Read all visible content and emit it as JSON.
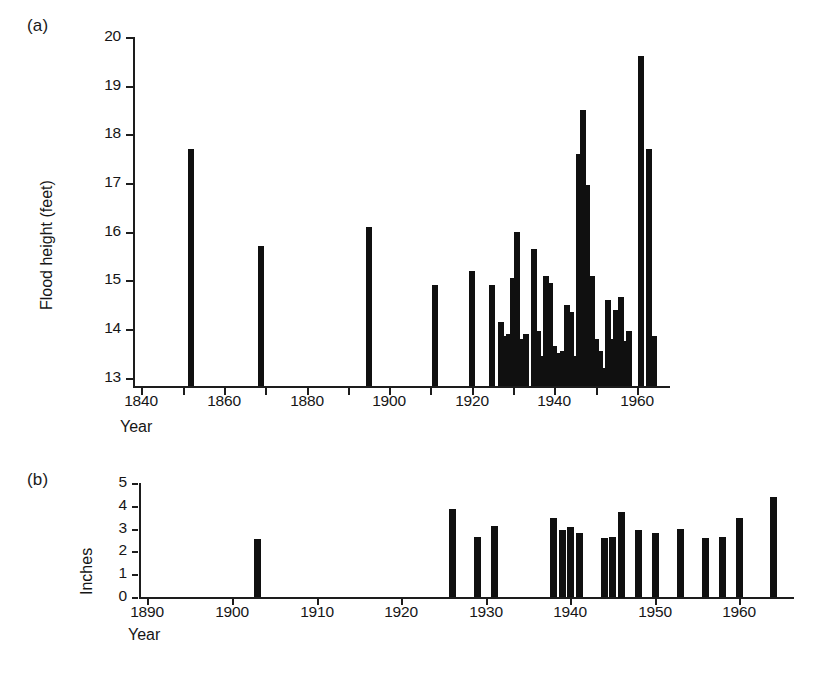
{
  "figure": {
    "background": "#ffffff",
    "ink_color": "#101010"
  },
  "panels": [
    {
      "tag": "(a)",
      "xlabel": "Year",
      "ylabel": "Flood height (feet)",
      "y_ticks": [
        "13",
        "14",
        "15",
        "16",
        "17",
        "18",
        "19",
        "20"
      ],
      "x_ticks": [
        "1840",
        "1860",
        "1880",
        "1900",
        "1920",
        "1940",
        "1960"
      ]
    },
    {
      "tag": "(b)",
      "xlabel": "Year",
      "ylabel": "Inches",
      "y_ticks": [
        "0",
        "1",
        "2",
        "3",
        "4",
        "5"
      ],
      "x_ticks": [
        "1890",
        "1900",
        "1910",
        "1920",
        "1930",
        "1940",
        "1950",
        "1960"
      ]
    }
  ],
  "chart_data": [
    {
      "id": "panel-a",
      "type": "bar",
      "title": "",
      "panel_label": "(a)",
      "xlabel": "Year",
      "ylabel": "Flood height (feet)",
      "xlim": [
        1838,
        1967
      ],
      "ylim": [
        12.83,
        20.0
      ],
      "y_tick_values": [
        13,
        14,
        15,
        16,
        17,
        18,
        19,
        20
      ],
      "x_tick_values": [
        1840,
        1860,
        1880,
        1900,
        1920,
        1940,
        1960
      ],
      "x_minor_tick_step": 10,
      "grid": false,
      "legend": null,
      "baseline": 12.83,
      "categories": [
        1852,
        1869,
        1895,
        1911,
        1920,
        1925,
        1927,
        1928,
        1929,
        1930,
        1931,
        1932,
        1933,
        1935,
        1936,
        1937,
        1938,
        1939,
        1940,
        1941,
        1942,
        1943,
        1944,
        1945,
        1946,
        1947,
        1948,
        1949,
        1950,
        1951,
        1952,
        1953,
        1954,
        1955,
        1956,
        1957,
        1958,
        1961,
        1963,
        1964
      ],
      "values": [
        17.7,
        15.7,
        16.1,
        14.9,
        15.2,
        14.9,
        14.15,
        13.85,
        13.9,
        15.05,
        16.0,
        13.8,
        13.9,
        15.65,
        13.95,
        13.45,
        15.1,
        14.95,
        13.65,
        13.5,
        13.55,
        14.5,
        14.35,
        13.45,
        17.6,
        18.5,
        16.95,
        15.1,
        13.8,
        13.55,
        13.2,
        14.6,
        13.8,
        14.4,
        14.65,
        13.75,
        13.95,
        19.6,
        17.7,
        13.85
      ]
    },
    {
      "id": "panel-b",
      "type": "bar",
      "title": "",
      "panel_label": "(b)",
      "xlabel": "Year",
      "ylabel": "Inches",
      "xlim": [
        1889,
        1966
      ],
      "ylim": [
        0,
        5
      ],
      "y_tick_values": [
        0,
        1,
        2,
        3,
        4,
        5
      ],
      "x_tick_values": [
        1890,
        1900,
        1910,
        1920,
        1930,
        1940,
        1950,
        1960
      ],
      "x_minor_tick_step": 10,
      "grid": false,
      "legend": null,
      "baseline": 0,
      "categories": [
        1903,
        1926,
        1929,
        1931,
        1938,
        1939,
        1940,
        1941,
        1944,
        1945,
        1946,
        1948,
        1950,
        1953,
        1956,
        1958,
        1960,
        1964
      ],
      "values": [
        2.55,
        3.85,
        2.65,
        3.1,
        3.45,
        2.95,
        3.05,
        2.8,
        2.6,
        2.65,
        3.75,
        2.95,
        2.8,
        3.0,
        2.6,
        2.65,
        3.45,
        4.4
      ]
    }
  ]
}
